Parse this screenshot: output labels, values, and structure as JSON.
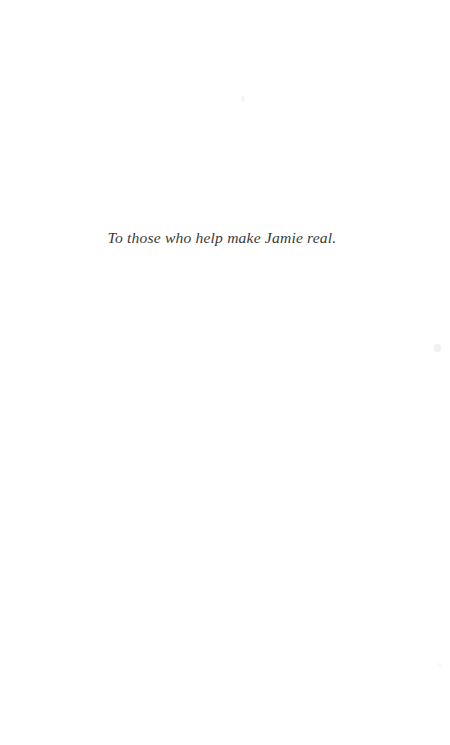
{
  "page": {
    "kind": "book-dedication-page",
    "width": 450,
    "height": 745,
    "background_color": "#ffffff",
    "text_color": "#3a3a3a"
  },
  "dedication": {
    "text": "To those who help make Jamie real."
  },
  "artifacts": [
    {
      "name": "scan-speck-top",
      "opacity": 0.035
    },
    {
      "name": "scan-speck-right",
      "opacity": 0.055
    },
    {
      "name": "scan-speck-bottom",
      "opacity": 0.018
    }
  ]
}
